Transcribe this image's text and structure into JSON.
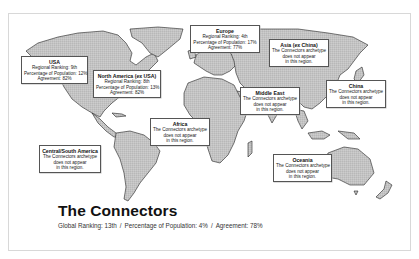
{
  "figure": {
    "title": "The Connectors",
    "summary": {
      "global_ranking_label": "Global Ranking: 13th",
      "population_label": "Percentage of Population: 4%",
      "agreement_label": "Agreement: 78%",
      "separator": "/"
    }
  },
  "regions": {
    "usa": {
      "name": "USA",
      "line1": "Regional Ranking: 9th",
      "line2": "Percentage of Population: 12%",
      "line3": "Agreement: 82%"
    },
    "north_america": {
      "name": "North America (ex USA)",
      "line1": "Regional Ranking: 8th",
      "line2": "Percentage of Population: 13%",
      "line3": "Agreement: 82%"
    },
    "europe": {
      "name": "Europe",
      "line1": "Regional Ranking: 4th",
      "line2": "Percentage of Population: 17%",
      "line3": "Agreement: 77%"
    },
    "asia": {
      "name": "Asia (ex China)",
      "line1": "The Connectors archetype",
      "line2": "does not appear",
      "line3": "in this region."
    },
    "middle_east": {
      "name": "Middle East",
      "line1": "The Connectors archetype",
      "line2": "does not appear",
      "line3": "in this region."
    },
    "china": {
      "name": "China",
      "line1": "The Connectors archetype",
      "line2": "does not appear",
      "line3": "in this region."
    },
    "africa": {
      "name": "Africa",
      "line1": "The Connectors archetype",
      "line2": "does not appear",
      "line3": "in this region."
    },
    "central_south_america": {
      "name": "Central/South America",
      "line1": "The Connectors archetype",
      "line2": "does not appear",
      "line3": "in this region."
    },
    "oceania": {
      "name": "Oceania",
      "line1": "The Connectors archetype",
      "line2": "does not appear",
      "line3": "in this region."
    }
  },
  "colors": {
    "land_dot": "#3a3a3a",
    "outline": "#222222",
    "frame": "#d8d8d8"
  }
}
